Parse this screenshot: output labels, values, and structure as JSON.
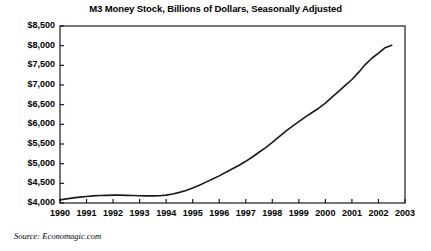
{
  "chart_data": {
    "type": "line",
    "title": "M3 Money Stock, Billions of Dollars, Seasonally Adjusted",
    "xlabel": "",
    "ylabel": "",
    "source": "Source: Economagic.com",
    "grid": false,
    "legend": null,
    "xlim": [
      1990,
      2003
    ],
    "ylim": [
      4000,
      8500
    ],
    "ytick_labels": [
      "$8,500",
      "$8,000",
      "$7,500",
      "$7,000",
      "$6,500",
      "$6,000",
      "$5,500",
      "$5,000",
      "$4,500",
      "$4,000"
    ],
    "ytick_values": [
      8500,
      8000,
      7500,
      7000,
      6500,
      6000,
      5500,
      5000,
      4500,
      4000
    ],
    "xtick_labels": [
      "1990",
      "1991",
      "1992",
      "1993",
      "1994",
      "1995",
      "1996",
      "1997",
      "1998",
      "1999",
      "2000",
      "2001",
      "2002",
      "2003"
    ],
    "xtick_values": [
      1990,
      1991,
      1992,
      1993,
      1994,
      1995,
      1996,
      1997,
      1998,
      1999,
      2000,
      2001,
      2002,
      2003
    ],
    "series": [
      {
        "name": "M3 Money Stock",
        "color": "#1a1a1a",
        "x": [
          1990.0,
          1990.25,
          1990.5,
          1990.75,
          1991.0,
          1991.25,
          1991.5,
          1991.75,
          1992.0,
          1992.25,
          1992.5,
          1992.75,
          1993.0,
          1993.25,
          1993.5,
          1993.75,
          1994.0,
          1994.25,
          1994.5,
          1994.75,
          1995.0,
          1995.25,
          1995.5,
          1995.75,
          1996.0,
          1996.25,
          1996.5,
          1996.75,
          1997.0,
          1997.25,
          1997.5,
          1997.75,
          1998.0,
          1998.25,
          1998.5,
          1998.75,
          1999.0,
          1999.25,
          1999.5,
          1999.75,
          2000.0,
          2000.25,
          2000.5,
          2000.75,
          2001.0,
          2001.25,
          2001.5,
          2001.75,
          2002.0,
          2002.25,
          2002.5
        ],
        "y": [
          4080,
          4105,
          4130,
          4150,
          4165,
          4180,
          4190,
          4195,
          4200,
          4200,
          4195,
          4190,
          4185,
          4180,
          4180,
          4185,
          4200,
          4230,
          4270,
          4320,
          4380,
          4450,
          4530,
          4610,
          4690,
          4780,
          4870,
          4960,
          5060,
          5170,
          5290,
          5410,
          5540,
          5680,
          5820,
          5950,
          6070,
          6190,
          6300,
          6410,
          6540,
          6690,
          6840,
          6990,
          7140,
          7320,
          7520,
          7680,
          7810,
          7950,
          8010
        ]
      }
    ]
  },
  "plot_geometry": {
    "left": 60,
    "right": 405,
    "top": 26,
    "bottom": 203
  }
}
